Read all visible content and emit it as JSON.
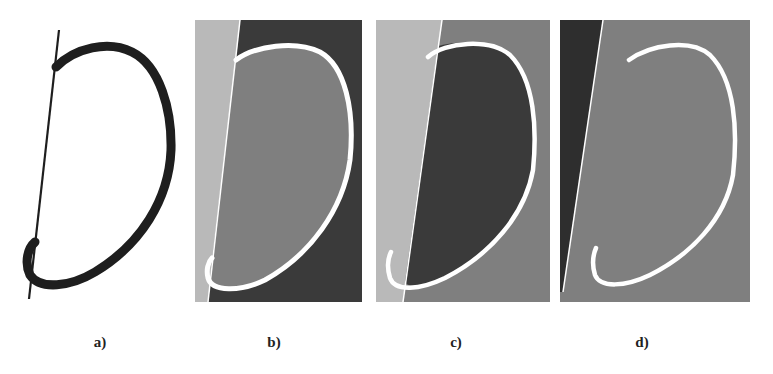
{
  "figure": {
    "panels": [
      {
        "id": "a",
        "label": "a)",
        "description": "Black D-shaped contour with straight tangent line on white background"
      },
      {
        "id": "b",
        "label": "b)",
        "description": "Segmentation: light left region, mid-gray interior, dark exterior, white contour"
      },
      {
        "id": "c",
        "label": "c)",
        "description": "Segmentation: light left region, dark interior, mid-gray exterior, white contour"
      },
      {
        "id": "d",
        "label": "d)",
        "description": "Segmentation: dark left wedge, uniform mid-gray elsewhere, white contour"
      }
    ],
    "colors": {
      "background": "#ffffff",
      "stroke_dark": "#1e1e1e",
      "light_gray": "#b9b9b9",
      "mid_gray": "#7f7f7f",
      "dark_gray": "#3a3a3a",
      "contour_white": "#ffffff"
    }
  }
}
